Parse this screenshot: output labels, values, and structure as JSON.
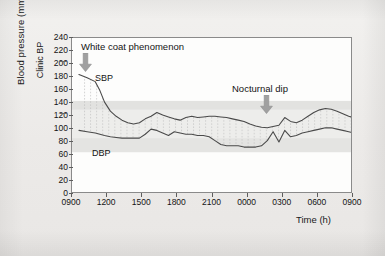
{
  "chart_data": {
    "type": "line",
    "title": "",
    "xlabel": "Time (h)",
    "ylabel": "Blood pressure (mmHg)",
    "ylabel_secondary": "Clinic BP",
    "ylim": [
      0,
      240
    ],
    "ytick_step": 20,
    "yticks": [
      "240",
      "220",
      "200",
      "180",
      "160",
      "140",
      "120",
      "100",
      "80",
      "60",
      "40",
      "20",
      "0"
    ],
    "xticks": [
      "0900",
      "1200",
      "1500",
      "1800",
      "2100",
      "0000",
      "0300",
      "0600",
      "0900"
    ],
    "xlim_hours": [
      9,
      33
    ],
    "grid": false,
    "legend_position": "inline",
    "series": [
      {
        "name": "SBP",
        "label": "SBP",
        "color": "#4a4a4a",
        "x": [
          9.6,
          10.3,
          11.0,
          11.4,
          11.8,
          12.3,
          12.8,
          13.3,
          13.8,
          14.3,
          14.8,
          15.3,
          15.8,
          16.3,
          16.8,
          17.3,
          17.8,
          18.3,
          18.8,
          19.3,
          19.8,
          20.3,
          20.8,
          21.3,
          21.8,
          22.3,
          22.8,
          23.3,
          23.8,
          24.3,
          24.8,
          25.3,
          25.8,
          26.3,
          26.8,
          27.3,
          27.8,
          28.3,
          28.8,
          29.3,
          29.8,
          30.3,
          30.8,
          31.3,
          31.8,
          32.3,
          32.8,
          33.0
        ],
        "values": [
          183,
          178,
          172,
          158,
          140,
          126,
          118,
          112,
          108,
          106,
          108,
          114,
          118,
          124,
          120,
          117,
          114,
          112,
          116,
          118,
          116,
          117,
          118,
          118,
          117,
          116,
          114,
          112,
          110,
          106,
          103,
          101,
          100,
          102,
          104,
          116,
          110,
          108,
          112,
          118,
          124,
          128,
          130,
          129,
          126,
          122,
          118,
          117
        ]
      },
      {
        "name": "DBP",
        "label": "DBP",
        "color": "#4a4a4a",
        "x": [
          9.6,
          10.3,
          11.0,
          11.4,
          11.8,
          12.3,
          12.8,
          13.3,
          13.8,
          14.3,
          14.8,
          15.3,
          15.8,
          16.3,
          16.8,
          17.3,
          17.8,
          18.3,
          18.8,
          19.3,
          19.8,
          20.3,
          20.8,
          21.3,
          21.8,
          22.3,
          22.8,
          23.3,
          23.8,
          24.3,
          24.8,
          25.3,
          25.8,
          26.3,
          26.8,
          27.3,
          27.8,
          28.3,
          28.8,
          29.3,
          29.8,
          30.3,
          30.8,
          31.3,
          31.8,
          32.3,
          32.8,
          33.0
        ],
        "values": [
          96,
          94,
          92,
          90,
          88,
          86,
          85,
          84,
          84,
          84,
          84,
          90,
          98,
          96,
          92,
          88,
          94,
          92,
          90,
          90,
          88,
          88,
          86,
          80,
          74,
          72,
          72,
          72,
          70,
          70,
          70,
          72,
          80,
          94,
          78,
          96,
          86,
          88,
          92,
          94,
          96,
          98,
          100,
          100,
          98,
          96,
          94,
          93
        ]
      }
    ],
    "bands": [
      {
        "name": "upper-reference-band",
        "from": 128,
        "to": 142,
        "color": "#e2e2e0"
      },
      {
        "name": "normal-range-band",
        "from": 84,
        "to": 128,
        "color": "#ededeb"
      },
      {
        "name": "lower-reference-band",
        "from": 62,
        "to": 84,
        "color": "#e4e4e2"
      }
    ],
    "annotations": [
      {
        "name": "white-coat-phenomenon",
        "text": "White coat phenomenon",
        "arrow": "down",
        "arrow_color": "#9a9a9a"
      },
      {
        "name": "nocturnal-dip",
        "text": "Nocturnal dip",
        "arrow": "down",
        "arrow_color": "#9a9a9a"
      }
    ]
  }
}
